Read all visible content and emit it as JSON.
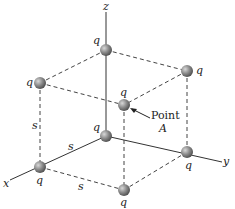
{
  "diagram": {
    "axes": {
      "x": "x",
      "y": "y",
      "z": "z"
    },
    "charge_label": "q",
    "side_label": "s",
    "point_label_line1": "Point",
    "point_label_line2": "A",
    "colors": {
      "line": "#333333",
      "sphere": "#8a8a8a",
      "sphere_highlight": "#c8c8c8",
      "text": "#222222"
    },
    "charges": [
      {
        "id": "top-back",
        "label": "q"
      },
      {
        "id": "top-left",
        "label": "q"
      },
      {
        "id": "top-right",
        "label": "q"
      },
      {
        "id": "top-front",
        "label": "q"
      },
      {
        "id": "bottom-back",
        "label": "q"
      },
      {
        "id": "bottom-left",
        "label": "q"
      },
      {
        "id": "bottom-right",
        "label": "q"
      },
      {
        "id": "bottom-front",
        "label": "q"
      }
    ]
  }
}
